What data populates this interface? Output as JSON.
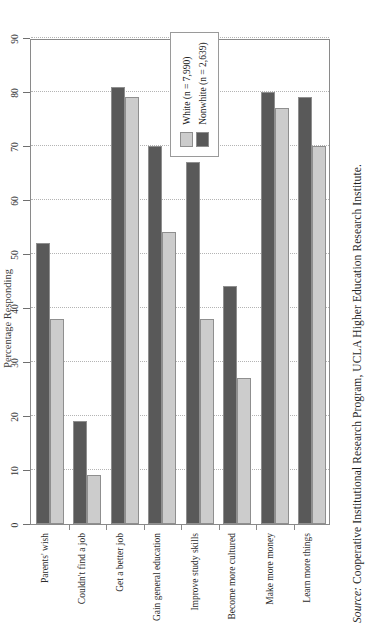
{
  "figure": {
    "source_prefix": "Source:",
    "source_text": " Cooperative Institutional Research Program, UCLA Higher Education Research Institute."
  },
  "legend": {
    "position": "inside-right",
    "items": [
      {
        "label": "White (n = 7,990)",
        "color": "#cccccc"
      },
      {
        "label": "Nonwhite (n = 2,639)",
        "color": "#595959"
      }
    ]
  },
  "chart_data": {
    "type": "bar",
    "orientation": "horizontal",
    "title": "",
    "xlabel": "Percentage Responding",
    "ylabel": "",
    "xlim": [
      0,
      90
    ],
    "xticks": [
      0,
      10,
      20,
      30,
      40,
      50,
      60,
      70,
      80,
      90
    ],
    "grid": true,
    "legend_position": "inside-right",
    "categories": [
      "Parents' wish",
      "Couldn't find a job",
      "Get a better job",
      "Gain general education",
      "Improve study skills",
      "Become more cultured",
      "Make more money",
      "Learn more things"
    ],
    "series": [
      {
        "name": "White (n = 7,990)",
        "color": "#cccccc",
        "values": [
          38,
          9,
          79,
          54,
          38,
          27,
          77,
          70
        ]
      },
      {
        "name": "Nonwhite (n = 2,639)",
        "color": "#595959",
        "values": [
          52,
          19,
          81,
          70,
          67,
          44,
          80,
          79
        ]
      }
    ]
  }
}
